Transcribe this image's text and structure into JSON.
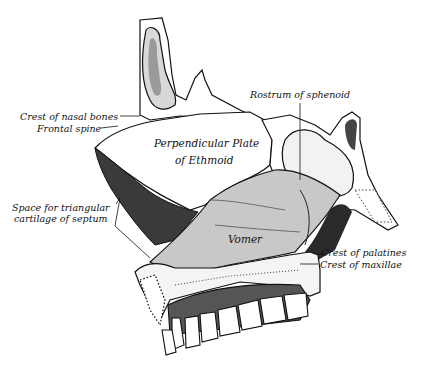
{
  "figure": {
    "colors": {
      "background": "#ffffff",
      "ink": "#111111",
      "vomer_fill": "#c8c8c8",
      "shadow": "#3a3a3a"
    }
  },
  "labels": {
    "crest_nasal_bones": "Crest of nasal bones",
    "frontal_spine": "Frontal spine",
    "rostrum_sphenoid": "Rostrum of sphenoid",
    "perp_plate_line1": "Perpendicular Plate",
    "perp_plate_line2": "of Ethmoid",
    "space_cartilage_line1": "Space for triangular",
    "space_cartilage_line2": "cartilage of septum",
    "vomer": "Vomer",
    "crest_palatines": "Crest of palatines",
    "crest_maxillae": "Crest of maxillae"
  }
}
